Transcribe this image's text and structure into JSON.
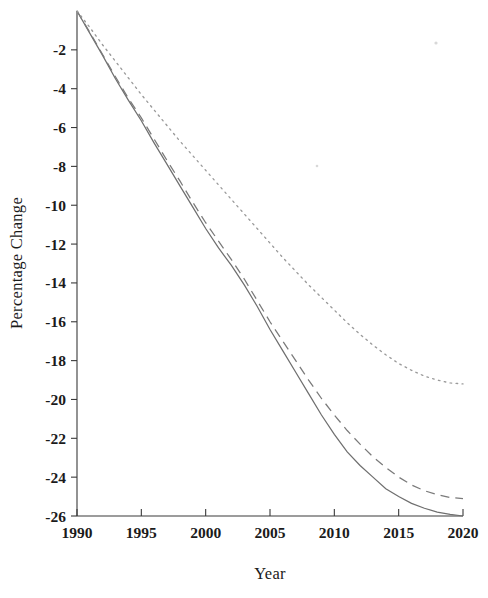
{
  "chart_data": {
    "type": "line",
    "title": "",
    "xlabel": "Year",
    "ylabel": "Percentage Change",
    "xlim": [
      1990,
      2020
    ],
    "ylim": [
      -26,
      0
    ],
    "grid": false,
    "legend": "none",
    "x_ticks": [
      1990,
      1995,
      2000,
      2005,
      2010,
      2015,
      2020
    ],
    "x_tick_labels": [
      "1990",
      "1995",
      "2000",
      "2005",
      "2010",
      "2015",
      "2020"
    ],
    "y_ticks": [
      -2,
      -4,
      -6,
      -8,
      -10,
      -12,
      -14,
      -16,
      -18,
      -20,
      -22,
      -24,
      -26
    ],
    "y_tick_labels": [
      "-2",
      "-4",
      "-6",
      "-8",
      "-10",
      "-12",
      "-14",
      "-16",
      "-18",
      "-20",
      "-22",
      "-24",
      "-26"
    ],
    "x": [
      1990,
      1991,
      1992,
      1993,
      1994,
      1995,
      1996,
      1997,
      1998,
      1999,
      2000,
      2001,
      2002,
      2003,
      2004,
      2005,
      2006,
      2007,
      2008,
      2009,
      2010,
      2011,
      2012,
      2013,
      2014,
      2015,
      2016,
      2017,
      2018,
      2019,
      2020
    ],
    "series": [
      {
        "name": "solid",
        "style": "solid",
        "color": "#6f6f6f",
        "values": [
          0,
          -1.15,
          -2.3,
          -3.5,
          -4.6,
          -5.65,
          -6.8,
          -7.9,
          -9.0,
          -10.1,
          -11.2,
          -12.2,
          -13.1,
          -14.1,
          -15.2,
          -16.4,
          -17.5,
          -18.6,
          -19.7,
          -20.8,
          -21.8,
          -22.7,
          -23.4,
          -24.0,
          -24.6,
          -25.0,
          -25.35,
          -25.6,
          -25.8,
          -25.92,
          -26.0
        ]
      },
      {
        "name": "dashed",
        "style": "dashed",
        "color": "#7a7a7a",
        "values": [
          0,
          -1.1,
          -2.25,
          -3.4,
          -4.5,
          -5.5,
          -6.6,
          -7.7,
          -8.75,
          -9.85,
          -10.9,
          -11.85,
          -12.8,
          -13.8,
          -14.9,
          -16.0,
          -17.0,
          -18.0,
          -19.0,
          -19.95,
          -20.8,
          -21.6,
          -22.3,
          -22.95,
          -23.5,
          -24.0,
          -24.4,
          -24.7,
          -24.9,
          -25.05,
          -25.1
        ]
      },
      {
        "name": "dotted",
        "style": "dotted",
        "color": "#9a9a9a",
        "values": [
          0,
          -0.85,
          -1.75,
          -2.6,
          -3.45,
          -4.3,
          -5.1,
          -5.9,
          -6.7,
          -7.45,
          -8.2,
          -8.95,
          -9.7,
          -10.45,
          -11.2,
          -11.95,
          -12.7,
          -13.4,
          -14.1,
          -14.75,
          -15.4,
          -16.05,
          -16.65,
          -17.2,
          -17.7,
          -18.15,
          -18.5,
          -18.8,
          -19.0,
          -19.15,
          -19.2
        ]
      }
    ]
  },
  "plot": {
    "left": 77,
    "right": 463,
    "top": 11,
    "bottom": 516
  }
}
